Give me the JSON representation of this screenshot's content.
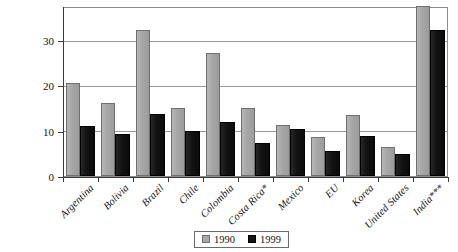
{
  "chart_data": {
    "type": "bar",
    "title": "",
    "subtitle": "",
    "xlabel": "",
    "ylabel": "",
    "ylim": [
      0,
      37.5
    ],
    "yticks": [
      0,
      10,
      20,
      30
    ],
    "ytick_labels": [
      "0",
      "10",
      "20",
      "30"
    ],
    "grid": true,
    "legend_position": "bottom",
    "categories": [
      "Argentina",
      "Bolivia",
      "Brazil",
      "Chile",
      "Colombia",
      "Costa Rica*",
      "Mexico",
      "EU",
      "Korea",
      "United States",
      "India***"
    ],
    "series": [
      {
        "name": "1990",
        "color": "#a8a8a8",
        "values": [
          20.5,
          16.1,
          32.2,
          15.0,
          27.2,
          15.0,
          11.2,
          8.7,
          13.4,
          6.3,
          37.4
        ]
      },
      {
        "name": "1999",
        "color": "#141414",
        "values": [
          11.1,
          9.2,
          13.7,
          10.0,
          11.9,
          7.3,
          10.3,
          5.6,
          8.8,
          4.8,
          32.3
        ]
      }
    ]
  },
  "legend": {
    "items": [
      {
        "label": "1990",
        "swatch": "gray-swatch"
      },
      {
        "label": "1999",
        "swatch": "black-swatch"
      }
    ]
  }
}
